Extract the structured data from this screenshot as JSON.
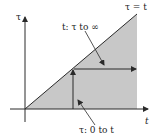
{
  "diagram": {
    "axes": {
      "vertical_label": "τ",
      "horizontal_label": "t"
    },
    "boundary_line": {
      "label": "τ = t"
    },
    "annotations": {
      "outer_integration": "t: τ to ∞",
      "inner_integration": "τ: 0 to t"
    },
    "colors": {
      "shaded_region": "#c8c8c8",
      "lines": "#2a2a2a",
      "background": "#ffffff"
    }
  }
}
